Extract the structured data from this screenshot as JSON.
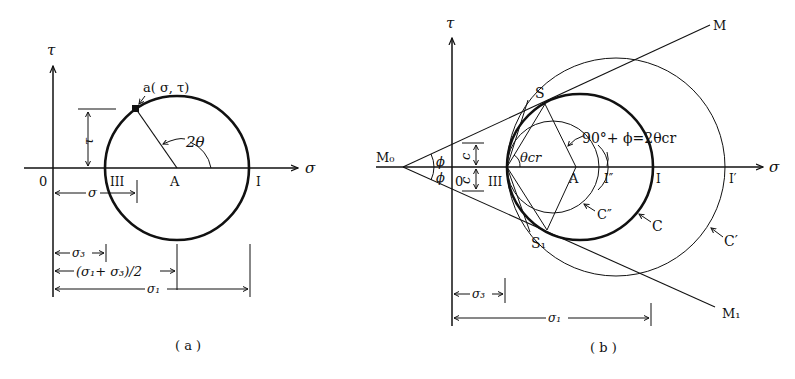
{
  "panel_a": {
    "caption": "( a )",
    "axis_tau": "τ",
    "axis_sigma": "σ",
    "origin": "0",
    "point_label": "a( σ, τ)",
    "angle_label": "2θ",
    "center_label": "A",
    "label_III": "III",
    "label_I": "I",
    "dim_tau": "τ",
    "dim_sigma": "σ",
    "dim_sigma3": "σ₃",
    "dim_mean": "(σ₁+ σ₃)/2",
    "dim_sigma1": "σ₁"
  },
  "panel_b": {
    "caption": "( b )",
    "axis_tau": "τ",
    "axis_sigma": "σ",
    "origin": "0",
    "vertex": "M₀",
    "phi_upper": "ϕ",
    "phi_lower": "ϕ",
    "c_upper": "c",
    "c_lower": "c",
    "theta_cr": "θcr",
    "angle_eq": "90°+ ϕ=2θcr",
    "label_S": "S",
    "label_S1": "S₁",
    "label_M": "M",
    "label_M1": "M₁",
    "label_III": "III",
    "label_A": "A",
    "label_I2": "I″",
    "label_I": "I",
    "label_I1": "I′",
    "circle_C": "C",
    "circle_C1": "C′",
    "circle_C2": "C″",
    "dim_sigma3": "σ₃",
    "dim_sigma1": "σ₁"
  },
  "colors": {
    "ink": "#111111",
    "paper": "#ffffff"
  }
}
